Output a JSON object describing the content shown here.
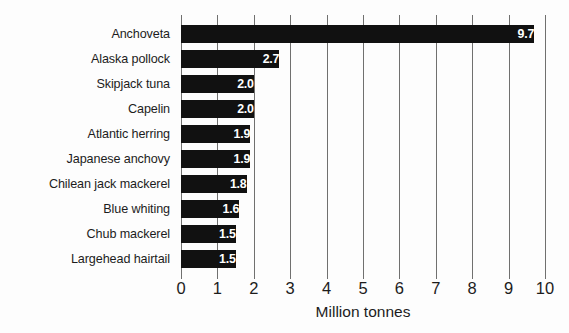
{
  "chart_data": {
    "type": "bar",
    "orientation": "horizontal",
    "title": "",
    "xlabel": "Million tonnes",
    "ylabel": "",
    "xlim": [
      0,
      10
    ],
    "xticks": [
      "0",
      "1",
      "2",
      "3",
      "4",
      "5",
      "6",
      "7",
      "8",
      "9",
      "10"
    ],
    "grid": true,
    "legend": false,
    "bar_color": "#111111",
    "value_label_color": "#ffffff",
    "categories": [
      "Anchoveta",
      "Alaska pollock",
      "Skipjack tuna",
      "Capelin",
      "Atlantic herring",
      "Japanese anchovy",
      "Chilean jack mackerel",
      "Blue whiting",
      "Chub mackerel",
      "Largehead hairtail"
    ],
    "values": [
      9.7,
      2.7,
      2.0,
      2.0,
      1.9,
      1.9,
      1.8,
      1.6,
      1.5,
      1.5
    ],
    "value_labels": [
      "9.7",
      "2.7",
      "2.0",
      "2.0",
      "1.9",
      "1.9",
      "1.8",
      "1.6",
      "1.5",
      "1.5"
    ]
  }
}
